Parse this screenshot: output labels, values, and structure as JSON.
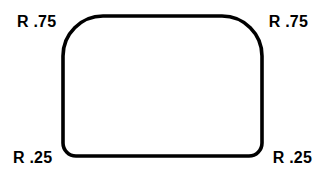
{
  "drawing": {
    "title": "Rounded corner radius callout drawing",
    "background_color": "#ffffff",
    "stroke_color": "#000000",
    "stroke_width": 3.6,
    "shape": {
      "name": "rounded-rectangle",
      "left": 63,
      "top": 16,
      "right": 262,
      "bottom": 156,
      "radius_top_left": 40,
      "radius_top_right": 40,
      "radius_bottom_left": 13,
      "radius_bottom_right": 13
    },
    "labels": {
      "top_left": "R .75",
      "top_right": "R .75",
      "bottom_left": "R .25",
      "bottom_right": "R .25"
    }
  }
}
